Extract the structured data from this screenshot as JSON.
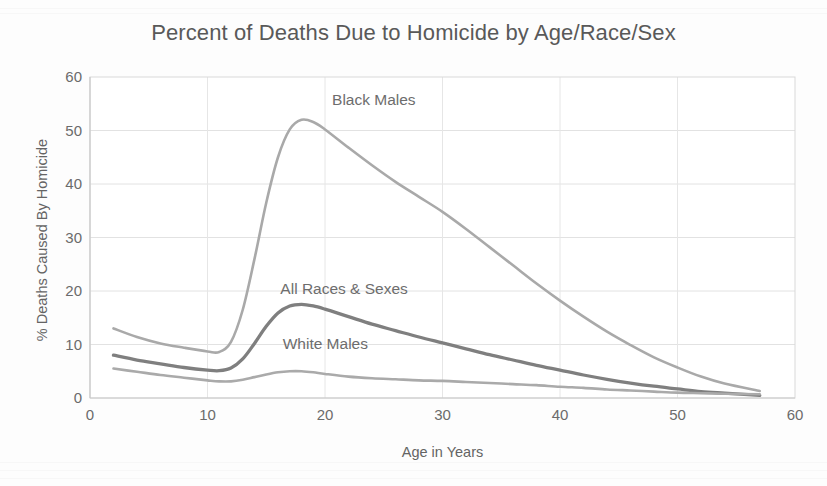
{
  "chart_data": {
    "type": "line",
    "title": "Percent of Deaths Due to Homicide by Age/Race/Sex",
    "xlabel": "Age in Years",
    "ylabel": "% Deaths Caused By Homicide",
    "xlim": [
      0,
      60
    ],
    "ylim": [
      0,
      60
    ],
    "xticks": [
      "0",
      "10",
      "20",
      "30",
      "40",
      "50",
      "60"
    ],
    "yticks": [
      "0",
      "10",
      "20",
      "30",
      "40",
      "50",
      "60"
    ],
    "grid": "both",
    "legend_position": "inline-annotations",
    "series": [
      {
        "name": "Black Males",
        "color": "#a9a9a9",
        "width": 2.6,
        "label_x": 20.6,
        "label_y": 55.5,
        "x": [
          2,
          4,
          6,
          8,
          10,
          11,
          12,
          13,
          14,
          15,
          16,
          17,
          18,
          19,
          20,
          22,
          24,
          26,
          28,
          30,
          32,
          34,
          36,
          38,
          40,
          42,
          44,
          46,
          48,
          50,
          52,
          54,
          57
        ],
        "y": [
          13.0,
          11.4,
          10.2,
          9.4,
          8.7,
          8.6,
          10.5,
          16.5,
          26.0,
          36.5,
          45.0,
          50.2,
          52.0,
          51.6,
          50.2,
          46.8,
          43.5,
          40.4,
          37.6,
          34.8,
          31.6,
          28.2,
          24.8,
          21.4,
          18.2,
          15.2,
          12.4,
          9.9,
          7.6,
          5.7,
          4.0,
          2.7,
          1.3
        ]
      },
      {
        "name": "All Races & Sexes",
        "color": "#7f7f7f",
        "width": 3.3,
        "label_x": 16.2,
        "label_y": 20.2,
        "x": [
          2,
          4,
          6,
          8,
          10,
          11,
          12,
          13,
          14,
          15,
          16,
          17,
          18,
          19,
          20,
          22,
          24,
          26,
          28,
          30,
          32,
          34,
          36,
          38,
          40,
          42,
          44,
          46,
          48,
          50,
          52,
          54,
          57
        ],
        "y": [
          8.0,
          7.1,
          6.4,
          5.7,
          5.2,
          5.1,
          5.6,
          7.3,
          10.2,
          13.4,
          15.9,
          17.2,
          17.5,
          17.2,
          16.6,
          15.2,
          13.8,
          12.6,
          11.4,
          10.3,
          9.2,
          8.1,
          7.1,
          6.1,
          5.2,
          4.3,
          3.5,
          2.8,
          2.2,
          1.7,
          1.2,
          0.9,
          0.5
        ]
      },
      {
        "name": "White Males",
        "color": "#aaaaaa",
        "width": 2.6,
        "label_x": 16.4,
        "label_y": 10.0,
        "x": [
          2,
          4,
          6,
          8,
          10,
          11,
          12,
          13,
          14,
          15,
          16,
          17,
          18,
          19,
          20,
          22,
          24,
          26,
          28,
          30,
          32,
          34,
          36,
          38,
          40,
          42,
          44,
          46,
          48,
          50,
          52,
          54,
          57
        ],
        "y": [
          5.5,
          4.9,
          4.3,
          3.8,
          3.3,
          3.1,
          3.1,
          3.4,
          3.9,
          4.4,
          4.8,
          5.0,
          5.0,
          4.8,
          4.5,
          4.0,
          3.7,
          3.5,
          3.3,
          3.2,
          3.0,
          2.8,
          2.6,
          2.4,
          2.1,
          1.9,
          1.6,
          1.4,
          1.2,
          1.0,
          0.9,
          0.8,
          0.7
        ]
      }
    ]
  }
}
